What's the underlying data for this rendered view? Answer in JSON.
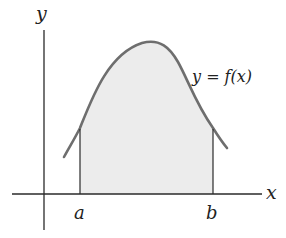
{
  "labels": {
    "y_axis": "y",
    "x_axis": "x",
    "a": "a",
    "b": "b",
    "curve": "y = f(x)"
  },
  "colors": {
    "axis": "#2a2a2a",
    "curve": "#6e6e6e",
    "fill": "#ececec",
    "text": "#222222"
  }
}
